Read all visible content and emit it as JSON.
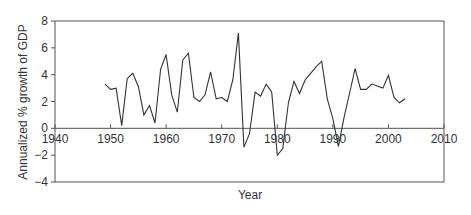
{
  "chart_data": {
    "type": "line",
    "title": "",
    "xlabel": "Year",
    "ylabel": "Annualized % growth of GDP",
    "xlim": [
      1940,
      2010
    ],
    "ylim": [
      -4,
      8
    ],
    "xticks": [
      1940,
      1950,
      1960,
      1970,
      1980,
      1990,
      2000,
      2010
    ],
    "yticks": [
      -4,
      -2,
      0,
      2,
      4,
      6,
      8
    ],
    "xtick_labels": [
      "1940",
      "1950",
      "1960",
      "1970",
      "1980",
      "1990",
      "2000",
      "2010"
    ],
    "ytick_labels": [
      "−4",
      "−2",
      "0",
      "2",
      "4",
      "6",
      "8"
    ],
    "grid": false,
    "legend": null,
    "x": [
      1949,
      1950,
      1951,
      1952,
      1953,
      1954,
      1955,
      1956,
      1957,
      1958,
      1959,
      1960,
      1961,
      1962,
      1963,
      1964,
      1965,
      1966,
      1967,
      1968,
      1969,
      1970,
      1971,
      1972,
      1973,
      1974,
      1975,
      1976,
      1977,
      1978,
      1979,
      1980,
      1981,
      1982,
      1983,
      1984,
      1985,
      1986,
      1987,
      1988,
      1989,
      1990,
      1991,
      1992,
      1993,
      1994,
      1995,
      1996,
      1997,
      1998,
      1999,
      2000,
      2001,
      2002,
      2003
    ],
    "series": [
      {
        "name": "GDP growth",
        "values": [
          3.3,
          2.9,
          3.0,
          0.2,
          3.7,
          4.1,
          3.1,
          1.0,
          1.7,
          0.4,
          4.4,
          5.5,
          2.5,
          1.2,
          5.1,
          5.6,
          2.3,
          2.0,
          2.5,
          4.2,
          2.2,
          2.3,
          2.0,
          3.6,
          7.1,
          -1.4,
          -0.4,
          2.7,
          2.4,
          3.3,
          2.7,
          -2.0,
          -1.5,
          1.9,
          3.5,
          2.6,
          3.6,
          4.1,
          4.6,
          5.0,
          2.2,
          0.7,
          -1.35,
          0.8,
          2.6,
          4.45,
          2.9,
          2.9,
          3.3,
          3.15,
          3.0,
          3.95,
          2.3,
          1.9,
          2.2
        ]
      }
    ]
  }
}
